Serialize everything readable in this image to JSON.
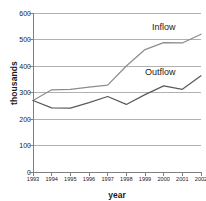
{
  "chart_data": {
    "type": "line",
    "title": "",
    "xlabel": "year",
    "ylabel": "thousands",
    "x": [
      1993,
      1994,
      1995,
      1996,
      1997,
      1998,
      1999,
      2000,
      2001,
      2002
    ],
    "xtick_labels": [
      "1993",
      "1994",
      "1995",
      "1996",
      "1997",
      "1998",
      "1999",
      "2000",
      "2001",
      "2002"
    ],
    "ytick_labels": [
      "0",
      "100",
      "200",
      "300",
      "400",
      "500",
      "600"
    ],
    "yticks": [
      0,
      100,
      200,
      300,
      400,
      500,
      600
    ],
    "ylim": [
      0,
      600
    ],
    "xlim": [
      1993,
      2002
    ],
    "grid": true,
    "grid_axis": "y",
    "legend_position": "inline-annotation",
    "series": [
      {
        "name": "Inflow",
        "label": "Inflow",
        "color": "#8c8c8c",
        "values": [
          270,
          310,
          312,
          320,
          328,
          400,
          462,
          488,
          487,
          520
        ]
      },
      {
        "name": "Outflow",
        "label": "Outflow",
        "color": "#5a5a5a",
        "values": [
          270,
          242,
          241,
          262,
          285,
          255,
          292,
          325,
          312,
          363
        ]
      }
    ]
  },
  "colors": {
    "axis": "#808080",
    "grid": "#a8a8a8",
    "text": "#1a1a1a",
    "background": "#ffffff",
    "inflow": "#8c8c8c",
    "outflow": "#5a5a5a"
  }
}
